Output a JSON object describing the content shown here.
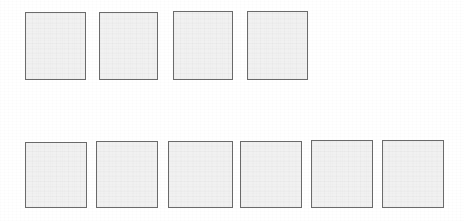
{
  "page": {
    "width": 464,
    "height": 221,
    "background_color": "#ffffff"
  },
  "style": {
    "box_fill_color": "#f1f1f1",
    "box_border_color": "#6b6b6b",
    "box_border_width": 1.5
  },
  "rows": [
    {
      "name": "top-row",
      "count": 4,
      "boxes": [
        {
          "label": "",
          "x": 25,
          "y": 12,
          "width": 61,
          "height": 68
        },
        {
          "label": "",
          "x": 99,
          "y": 12,
          "width": 59,
          "height": 68
        },
        {
          "label": "",
          "x": 173,
          "y": 11,
          "width": 60,
          "height": 69
        },
        {
          "label": "",
          "x": 247,
          "y": 11,
          "width": 61,
          "height": 69
        }
      ]
    },
    {
      "name": "bottom-row",
      "count": 6,
      "boxes": [
        {
          "label": "",
          "x": 25,
          "y": 142,
          "width": 62,
          "height": 66
        },
        {
          "label": "",
          "x": 96,
          "y": 141,
          "width": 62,
          "height": 67
        },
        {
          "label": "",
          "x": 168,
          "y": 141,
          "width": 65,
          "height": 67
        },
        {
          "label": "",
          "x": 240,
          "y": 141,
          "width": 62,
          "height": 67
        },
        {
          "label": "",
          "x": 311,
          "y": 140,
          "width": 62,
          "height": 68
        },
        {
          "label": "",
          "x": 382,
          "y": 140,
          "width": 62,
          "height": 68
        }
      ]
    }
  ]
}
